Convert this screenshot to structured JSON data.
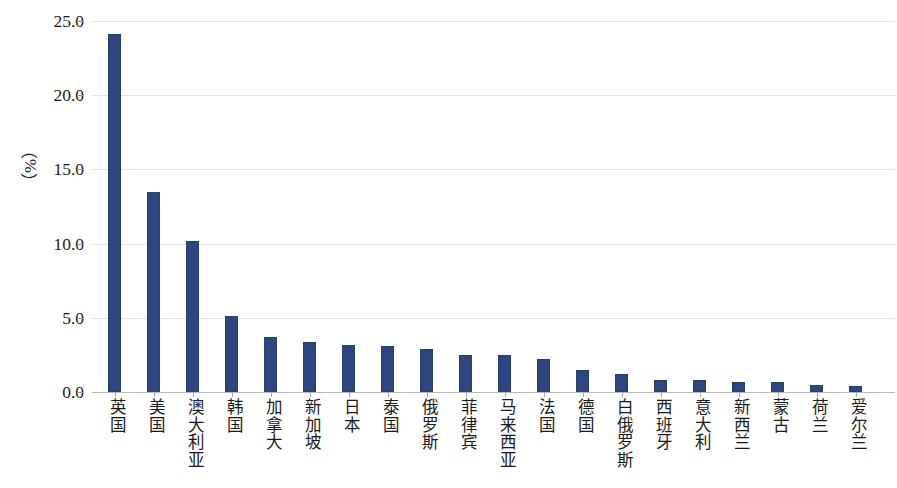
{
  "chart_data": {
    "type": "bar",
    "title": "",
    "subtitle": "",
    "xlabel": "",
    "ylabel": "（%）",
    "ylim": [
      0,
      25
    ],
    "yticks": [
      "0.0",
      "5.0",
      "10.0",
      "15.0",
      "20.0",
      "25.0"
    ],
    "ytick_values": [
      0,
      5,
      10,
      15,
      20,
      25
    ],
    "grid": true,
    "legend": false,
    "legend_position": "none",
    "series_color": "#2e4680",
    "categories": [
      "英国",
      "美国",
      "澳大利亚",
      "韩国",
      "加拿大",
      "新加坡",
      "日本",
      "泰国",
      "俄罗斯",
      "菲律宾",
      "马来西亚",
      "法国",
      "德国",
      "白俄罗斯",
      "西班牙",
      "意大利",
      "新西兰",
      "蒙古",
      "荷兰",
      "爱尔兰"
    ],
    "values": [
      24.1,
      13.5,
      10.2,
      5.1,
      3.7,
      3.4,
      3.2,
      3.1,
      2.9,
      2.5,
      2.5,
      2.2,
      1.5,
      1.2,
      0.8,
      0.8,
      0.7,
      0.7,
      0.5,
      0.4
    ]
  }
}
